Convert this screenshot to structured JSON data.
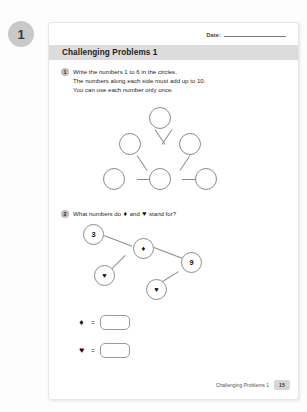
{
  "unit_badge": "1",
  "sheet": {
    "date_label": "Date:",
    "title": "Challenging Problems 1"
  },
  "questions": [
    {
      "number": "1",
      "lines": [
        "Write the numbers 1 to 6 in the circles.",
        "The numbers along each side must add up to 10.",
        "You can use each number only once."
      ]
    },
    {
      "number": "2",
      "prefix": "What numbers do",
      "sym_a": "♦",
      "mid": "and",
      "sym_b": "♥",
      "suffix": "stand for?"
    }
  ],
  "triangle_diagram": {
    "nodes": [
      {
        "id": "apex",
        "label": ""
      },
      {
        "id": "mid-left",
        "label": ""
      },
      {
        "id": "mid-right",
        "label": ""
      },
      {
        "id": "bottom-left",
        "label": ""
      },
      {
        "id": "bottom-mid",
        "label": ""
      },
      {
        "id": "bottom-right",
        "label": ""
      }
    ]
  },
  "network_diagram": {
    "nodes": [
      {
        "id": "n-three",
        "label": "3"
      },
      {
        "id": "n-diamond",
        "label": "♦"
      },
      {
        "id": "n-nine",
        "label": "9"
      },
      {
        "id": "n-heart-1",
        "label": "♥"
      },
      {
        "id": "n-heart-2",
        "label": "♥"
      }
    ]
  },
  "answers": [
    {
      "symbol": "♦",
      "equals": "=",
      "value": ""
    },
    {
      "symbol": "♥",
      "equals": "=",
      "value": ""
    }
  ],
  "footer": {
    "title": "Challenging Problems 1",
    "page": "15"
  }
}
